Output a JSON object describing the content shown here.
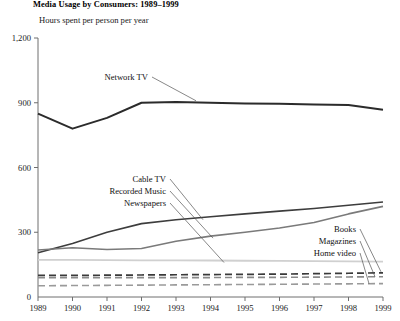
{
  "chart_data": {
    "type": "line",
    "title": "Media Usage by Consumers: 1989–1999",
    "subtitle": "Hours spent per person per year",
    "xlabel": "",
    "ylabel": "Hours spent per person per year",
    "x": [
      1989,
      1990,
      1991,
      1992,
      1993,
      1994,
      1995,
      1996,
      1997,
      1998,
      1999
    ],
    "xticklabels": [
      "1989",
      "1990",
      "1991",
      "1992",
      "1993",
      "1994",
      "1995",
      "1996",
      "1997",
      "1998",
      "1999"
    ],
    "yticklabels": [
      "0",
      "300",
      "600",
      "900",
      "1,200"
    ],
    "yticks": [
      0,
      300,
      600,
      900,
      1200
    ],
    "ylim": [
      0,
      1200
    ],
    "xlim": [
      1989,
      1999
    ],
    "grid": false,
    "legend_position": "inline-annotations",
    "series": [
      {
        "name": "Network TV",
        "color": "#2b2b2b",
        "width": 2.0,
        "style": "solid",
        "values": [
          850,
          780,
          830,
          900,
          903,
          900,
          897,
          895,
          892,
          890,
          868
        ]
      },
      {
        "name": "Cable TV",
        "color": "#3d3d3d",
        "width": 1.6,
        "style": "solid",
        "values": [
          205,
          248,
          300,
          340,
          358,
          372,
          385,
          398,
          410,
          425,
          440
        ]
      },
      {
        "name": "Recorded Music",
        "color": "#7a7a7a",
        "width": 1.6,
        "style": "solid",
        "values": [
          218,
          228,
          220,
          225,
          258,
          282,
          300,
          320,
          345,
          385,
          420
        ]
      },
      {
        "name": "Newspapers",
        "color": "#d0d0d0",
        "width": 1.8,
        "style": "solid",
        "values": [
          172,
          172,
          171,
          170,
          170,
          169,
          168,
          167,
          166,
          165,
          164
        ]
      },
      {
        "name": "Books",
        "color": "#3a3a3a",
        "width": 1.7,
        "style": "dashed",
        "values": [
          100,
          100,
          101,
          102,
          103,
          104,
          105,
          106,
          108,
          110,
          112
        ]
      },
      {
        "name": "Magazines",
        "color": "#8a8a8a",
        "width": 1.6,
        "style": "dashed",
        "values": [
          90,
          90,
          90,
          90,
          90,
          90,
          91,
          91,
          92,
          93,
          94
        ]
      },
      {
        "name": "Home video",
        "color": "#9a9a9a",
        "width": 1.6,
        "style": "dashed",
        "values": [
          52,
          53,
          54,
          55,
          56,
          57,
          58,
          59,
          60,
          61,
          62
        ]
      }
    ],
    "annotations": [
      {
        "name": "Network TV",
        "text": "Network TV",
        "align": "left"
      },
      {
        "name": "Cable TV",
        "text": "Cable TV",
        "align": "right"
      },
      {
        "name": "Recorded Music",
        "text": "Recorded Music",
        "align": "right"
      },
      {
        "name": "Newspapers",
        "text": "Newspapers",
        "align": "right"
      },
      {
        "name": "Books",
        "text": "Books",
        "align": "right"
      },
      {
        "name": "Magazines",
        "text": "Magazines",
        "align": "right"
      },
      {
        "name": "Home video",
        "text": "Home video",
        "align": "right"
      }
    ]
  }
}
